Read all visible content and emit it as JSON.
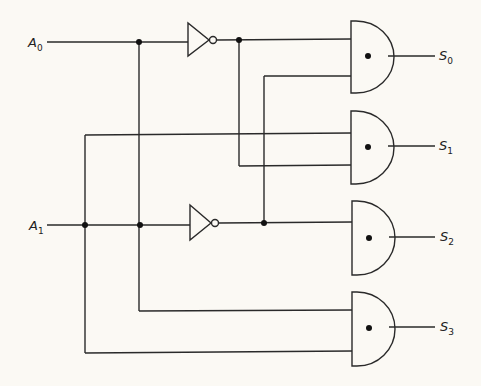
{
  "diagram": {
    "type": "2-to-4 decoder logic circuit",
    "inputs": [
      {
        "name": "A",
        "sub": "0",
        "y": 42
      },
      {
        "name": "A",
        "sub": "1",
        "y": 225
      }
    ],
    "outputs": [
      {
        "name": "S",
        "sub": "0",
        "y": 56
      },
      {
        "name": "S",
        "sub": "1",
        "y": 146
      },
      {
        "name": "S",
        "sub": "2",
        "y": 237
      },
      {
        "name": "S",
        "sub": "3",
        "y": 327
      }
    ],
    "gates": {
      "not": [
        "NOT A0",
        "NOT A1"
      ],
      "and": [
        "AND S0",
        "AND S1",
        "AND S2",
        "AND S3"
      ]
    },
    "colors": {
      "background": "#fbf9f4",
      "line": "#2a2a2a"
    }
  }
}
